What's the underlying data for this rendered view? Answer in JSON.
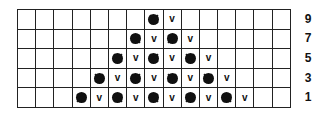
{
  "chart": {
    "columns": 15,
    "rows": [
      {
        "label": "9",
        "cells": [
          "",
          "",
          "",
          "",
          "",
          "",
          "",
          "bobble",
          "v",
          "",
          "",
          "",
          "",
          "",
          ""
        ]
      },
      {
        "label": "7",
        "cells": [
          "",
          "",
          "",
          "",
          "",
          "",
          "bobble",
          "v",
          "bobble",
          "v",
          "",
          "",
          "",
          "",
          ""
        ]
      },
      {
        "label": "5",
        "cells": [
          "",
          "",
          "",
          "",
          "",
          "bobble",
          "v",
          "bobble",
          "v",
          "bobble",
          "v",
          "",
          "",
          "",
          ""
        ]
      },
      {
        "label": "3",
        "cells": [
          "",
          "",
          "",
          "",
          "bobble",
          "v",
          "bobble",
          "v",
          "bobble",
          "v",
          "bobble",
          "v",
          "",
          "",
          ""
        ]
      },
      {
        "label": "1",
        "cells": [
          "",
          "",
          "",
          "bobble",
          "v",
          "bobble",
          "v",
          "bobble",
          "v",
          "bobble",
          "v",
          "bobble",
          "v",
          "",
          ""
        ]
      }
    ],
    "symbols": {
      "bobble": "star-burst-icon",
      "v": "v"
    }
  }
}
